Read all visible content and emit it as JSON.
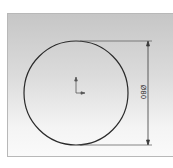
{
  "sketch": {
    "shape": "circle",
    "dimension": {
      "label": "Ø80",
      "orientation": "vertical"
    },
    "origin_marker": "origin-axes-icon",
    "colors": {
      "line": "#2a2a2a",
      "dimension": "#3a3a3a",
      "background_top": "#c6c6c6",
      "background_bottom": "#fafafa"
    }
  }
}
